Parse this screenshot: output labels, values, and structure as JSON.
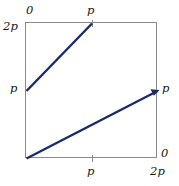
{
  "figure": {
    "type": "line-plot",
    "line_color": "#1b2a6b",
    "frame_color": "#8a8a8a",
    "background": "#ffffff"
  },
  "labels": {
    "top_left_2p": "2p",
    "top_zero": "0",
    "top_p": "p",
    "left_p": "p",
    "right_p": "p",
    "bottom_right_zero": "0",
    "bottom_p": "p",
    "bottom_right_2p": "2p"
  },
  "chart_data": {
    "type": "line",
    "title": "",
    "xlabel": "",
    "ylabel": "",
    "xlim": [
      0,
      2
    ],
    "ylim": [
      0,
      2
    ],
    "x_tick_values": [
      0,
      1,
      2
    ],
    "x_tick_labels": [
      "0",
      "p",
      "2p"
    ],
    "y_tick_values": [
      0,
      1,
      2
    ],
    "y_tick_labels": [
      "0",
      "p",
      "2p"
    ],
    "y_axis_direction": "top-is-2p (left axis labelled 2p at top, p at middle)",
    "grid": false,
    "legend": false,
    "series": [
      {
        "name": "upper-segment",
        "x": [
          0,
          1
        ],
        "y": [
          1,
          2
        ],
        "color": "#1b2a6b",
        "arrow_end": false
      },
      {
        "name": "lower-segment",
        "x": [
          0,
          2
        ],
        "y": [
          0,
          1
        ],
        "color": "#1b2a6b",
        "arrow_end": true
      }
    ],
    "ticks_drawn": [
      "top-center",
      "bottom-center"
    ],
    "annotations": []
  }
}
